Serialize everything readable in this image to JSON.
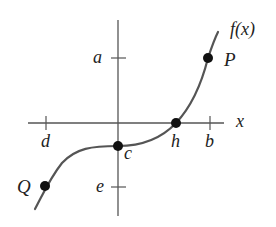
{
  "figure": {
    "function_label": "f(x)",
    "axis_label_x": "x",
    "y_ticks": [
      {
        "label": "a",
        "y": 58
      },
      {
        "label": "e",
        "y": 187
      }
    ],
    "x_ticks": [
      {
        "label": "d",
        "x": 46
      },
      {
        "label": "b",
        "x": 210
      }
    ],
    "points": [
      {
        "label": "P",
        "x": 208,
        "y": 58
      },
      {
        "label": "h",
        "x": 176,
        "y": 123
      },
      {
        "label": "c",
        "x": 118,
        "y": 146
      },
      {
        "label": "Q",
        "x": 45,
        "y": 186
      }
    ],
    "colors": {
      "axis": "#555555",
      "curve": "#555555",
      "point": "#111111",
      "text": "#222222"
    }
  }
}
